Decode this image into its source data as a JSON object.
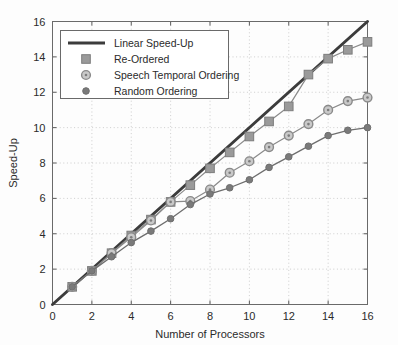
{
  "chart_data": {
    "type": "line",
    "title": "",
    "xlabel": "Number of Processors",
    "ylabel": "Speed-Up",
    "xlim": [
      0,
      16
    ],
    "ylim": [
      0,
      16
    ],
    "xticks": [
      0,
      2,
      4,
      6,
      8,
      10,
      12,
      14,
      16
    ],
    "yticks": [
      0,
      2,
      4,
      6,
      8,
      10,
      12,
      14,
      16
    ],
    "xtick_labels": [
      "0",
      "2",
      "4",
      "6",
      "8",
      "10",
      "12",
      "14",
      "16"
    ],
    "ytick_labels": [
      "0",
      "2",
      "4",
      "6",
      "8",
      "10",
      "12",
      "14",
      "16"
    ],
    "grid": true,
    "legend_position": "upper left",
    "x": [
      1,
      2,
      3,
      4,
      5,
      6,
      7,
      8,
      9,
      10,
      11,
      12,
      13,
      14,
      15,
      16
    ],
    "series": [
      {
        "name": "Linear Speed-Up",
        "marker": "none",
        "color": "#3c3c3c",
        "line_width": 3,
        "x": [
          0,
          16
        ],
        "values": [
          0,
          16
        ]
      },
      {
        "name": "Re-Ordered",
        "marker": "square",
        "color": "#8a8a8a",
        "marker_color": "#9a9a9a",
        "line_width": 1.2,
        "values": [
          1.0,
          1.9,
          2.9,
          3.9,
          4.8,
          5.8,
          6.75,
          7.7,
          8.6,
          9.5,
          10.35,
          11.2,
          13.0,
          13.9,
          14.4,
          14.85
        ]
      },
      {
        "name": "Speech Temporal Ordering",
        "marker": "circle-dot",
        "color": "#8a8a8a",
        "marker_color": "#9a9a9a",
        "line_width": 1.2,
        "values": [
          1.0,
          1.9,
          2.9,
          3.8,
          4.75,
          5.8,
          5.85,
          6.5,
          7.45,
          8.1,
          8.9,
          9.55,
          10.2,
          11.0,
          11.5,
          11.7
        ]
      },
      {
        "name": "Random Ordering",
        "marker": "circle-filled",
        "color": "#6e6e6e",
        "marker_color": "#7a7a7a",
        "line_width": 1.3,
        "values": [
          1.0,
          1.9,
          2.7,
          3.5,
          4.15,
          4.85,
          5.65,
          6.25,
          6.6,
          7.05,
          7.75,
          8.35,
          8.95,
          9.55,
          9.85,
          10.0
        ]
      }
    ]
  },
  "legend": {
    "entries": [
      {
        "label": "Linear Speed-Up",
        "marker": "none"
      },
      {
        "label": "Re-Ordered",
        "marker": "square"
      },
      {
        "label": "Speech Temporal Ordering",
        "marker": "circle-dot"
      },
      {
        "label": "Random Ordering",
        "marker": "circle-filled"
      }
    ]
  },
  "colors": {
    "linear": "#3c3c3c",
    "reordered": "#9a9a9a",
    "speech": "#9a9a9a",
    "random": "#7a7a7a",
    "axis": "#5a5a5a",
    "grid": "#b9b9b9",
    "text": "#2b2b2b"
  }
}
